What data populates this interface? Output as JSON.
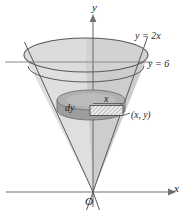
{
  "figure": {
    "axes": {
      "y_axis_label": "y",
      "x_axis_label": "x",
      "origin_label": "O"
    },
    "annotations": {
      "line_equation": "y = 2x",
      "plane_equation": "y = 6",
      "thickness_label": "dy",
      "radius_label": "x",
      "point_label": "(x, y)"
    },
    "colors": {
      "stroke": "#58585a",
      "axis": "#6b6b6d",
      "cone_fill": "#dedede",
      "cone_fill_dark": "#c9c9c9",
      "top_ellipse_fill": "#cfcfcf",
      "disk_fill": "#a8a8a8",
      "disk_fill_dark": "#9a9a9a",
      "hatch_fill": "#e8e8e8",
      "hatch_line": "#6e6e6e",
      "label_color": "#1a1a1a",
      "background": "#ffffff"
    },
    "geometry": {
      "apex": {
        "x": 93,
        "y": 192
      },
      "top_ellipse": {
        "cx": 86,
        "cy": 55,
        "rx": 62,
        "ry": 17
      },
      "bottom_rim_ellipse": {
        "cx": 86,
        "cy": 66,
        "rx": 62,
        "ry": 17
      },
      "disk_top_ellipse": {
        "cx": 91,
        "cy": 100,
        "rx": 34,
        "ry": 10
      },
      "disk_bottom_ellipse": {
        "cx": 91,
        "cy": 110,
        "rx": 34,
        "ry": 10
      },
      "hatch_rect": {
        "x": 90,
        "y": 105,
        "width": 33,
        "height": 10
      },
      "plane_line_y": 62,
      "x_axis_y": 192,
      "y_axis_x": 93
    }
  }
}
